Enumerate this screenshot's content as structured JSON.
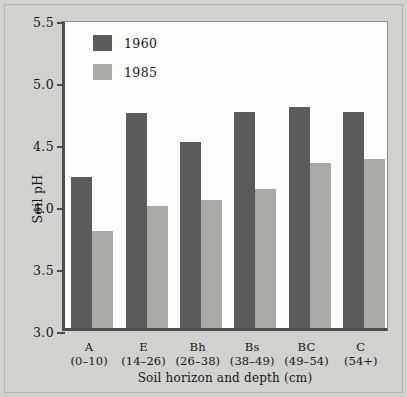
{
  "chart_data": {
    "type": "bar",
    "title": "",
    "xlabel": "Soil horizon and depth (cm)",
    "ylabel": "Soil pH",
    "ylim": [
      3.0,
      5.5
    ],
    "yticks": [
      "3.0",
      "3.5",
      "4.0",
      "4.5",
      "5.0",
      "5.5"
    ],
    "grid": false,
    "legend_position": "top-left",
    "categories": [
      "A",
      "E",
      "Bh",
      "Bs",
      "BC",
      "C"
    ],
    "category_depths": [
      "(0–10)",
      "(14–26)",
      "(26–38)",
      "(38–49)",
      "(49–54)",
      "(54+)"
    ],
    "series": [
      {
        "name": "1960",
        "color": "#5b5b5b",
        "values": [
          4.22,
          4.73,
          4.5,
          4.74,
          4.78,
          4.74
        ]
      },
      {
        "name": "1985",
        "color": "#a9a9a6",
        "values": [
          3.78,
          3.98,
          4.03,
          4.12,
          4.33,
          4.36
        ]
      }
    ]
  },
  "legend": {
    "items": [
      {
        "label": "1960"
      },
      {
        "label": "1985"
      }
    ]
  },
  "axes": {
    "y_title": "Soil pH",
    "x_title": "Soil horizon and depth (cm)"
  }
}
